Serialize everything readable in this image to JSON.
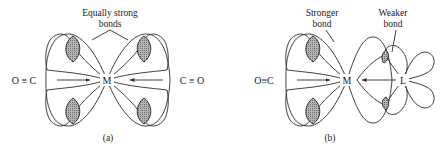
{
  "figure": {
    "panels": [
      {
        "id": "a",
        "caption": "(a)",
        "annotation_line1": "Equally strong",
        "annotation_line2": "bonds",
        "left_ligand": "O ≡ C",
        "center_atom": "M",
        "right_ligand": "C ≡ O"
      },
      {
        "id": "b",
        "caption": "(b)",
        "annotation_left_line1": "Stronger",
        "annotation_left_line2": "bond",
        "annotation_right_line1": "Weaker",
        "annotation_right_line2": "bond",
        "left_ligand": "O≡C",
        "center_atom": "M",
        "right_ligand": "L"
      }
    ],
    "colors": {
      "line": "#2a2a2a",
      "shading": "#9a9a9a",
      "background": "#ffffff"
    }
  }
}
